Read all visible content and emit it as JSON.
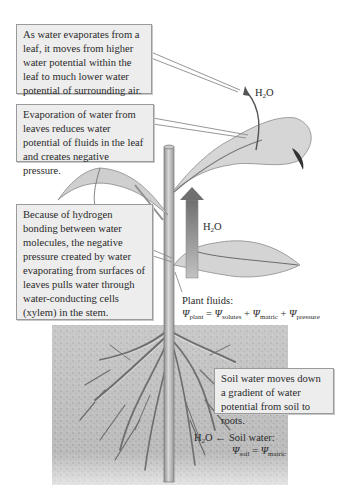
{
  "diagram": {
    "colors": {
      "callout_bg": "#ededed",
      "callout_border": "#9a9a9a",
      "soil": "#b9b9b9",
      "leaf": "#cfcfcf",
      "stem": "#bdbdbd",
      "arrow": "#777777"
    },
    "callouts": {
      "leaf_evaporation": "As water evaporates from a leaf, it moves from higher water potential within the leaf to much lower water potential of surrounding air.",
      "negative_pressure": "Evaporation of water from leaves reduces water potential of fluids in the leaf and creates negative pressure.",
      "hydrogen_bonding": "Because of hydrogen bonding between water molecules, the negative pressure created by water evaporating from surfaces of leaves pulls water through water-conducting cells (xylem) in the stem.",
      "soil_gradient": "Soil water moves down a gradient of water potential from soil to roots."
    },
    "labels": {
      "h2o_top": {
        "main": "H",
        "sub": "2",
        "tail": "O"
      },
      "h2o_mid": {
        "main": "H",
        "sub": "2",
        "tail": "O"
      },
      "h2o_soil": {
        "main": "H",
        "sub": "2",
        "tail": "O"
      },
      "plant_fluids_title": "Plant fluids:",
      "plant_equation": {
        "psi": "Ψ",
        "lhs_sub": "plant",
        "eq": " = ",
        "t1_sub": "solutes",
        "plus": " + ",
        "t2_sub": "matric",
        "t3_sub": "pressure"
      },
      "soil_water_title": "Soil water:",
      "soil_equation": {
        "psi": "Ψ",
        "lhs_sub": "soil",
        "eq": " = ",
        "rhs_sub": "matric"
      }
    }
  }
}
